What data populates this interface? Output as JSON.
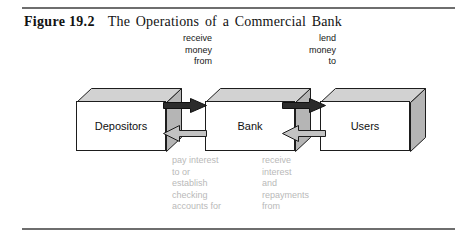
{
  "figure": {
    "number": "Figure 19.2",
    "title": "The Operations of a Commercial Bank"
  },
  "entities": {
    "depositors": "Depositors",
    "bank": "Bank",
    "users": "Users"
  },
  "flows": {
    "receive_money_from": "receive\nmoney\nfrom",
    "lend_money_to": "lend\nmoney\nto",
    "pay_interest": "pay interest\nto or\nestablish\nchecking\naccounts for",
    "receive_interest": "receive\ninterest\nand\nrepayments\nfrom"
  },
  "colors": {
    "rule": "#6e6e6e",
    "caption_text": "#121212",
    "top_label_text": "#161616",
    "bottom_label_text": "#b9b9b9",
    "box_front": "#ffffff",
    "box_top": "#d2d2d2",
    "box_side": "#b5b5b5",
    "box_outline": "#1d1d1d",
    "arrow_forward": "#2b2b2b",
    "arrow_return": "#c3c3c3"
  }
}
